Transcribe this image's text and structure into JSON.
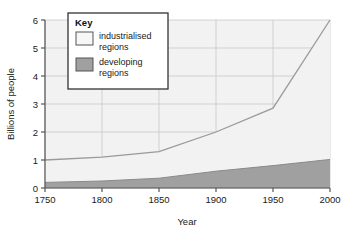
{
  "chart_data": {
    "type": "area",
    "title": "",
    "xlabel": "Year",
    "ylabel": "Billions of people",
    "x": [
      1750,
      1800,
      1850,
      1900,
      1950,
      2000
    ],
    "xlim": [
      1750,
      2000
    ],
    "ylim": [
      0,
      6
    ],
    "xticks": [
      "1750",
      "1800",
      "1850",
      "1900",
      "1950",
      "2000"
    ],
    "yticks": [
      "0",
      "1",
      "2",
      "3",
      "4",
      "5",
      "6"
    ],
    "grid": true,
    "stacked": true,
    "legend_position": "top-left-inside",
    "legend_title": "Key",
    "series": [
      {
        "name": "developing regions",
        "values": [
          0.2,
          0.25,
          0.35,
          0.6,
          0.8,
          1.02
        ],
        "color": "#a0a0a0"
      },
      {
        "name": "industrialised regions",
        "values": [
          0.8,
          0.85,
          0.95,
          1.4,
          2.05,
          4.98
        ],
        "color": "#f2f2f2"
      }
    ],
    "totals": [
      1.0,
      1.1,
      1.3,
      2.0,
      2.85,
      6.0
    ],
    "annotations": []
  },
  "axes": {
    "y_title": "Billions of people",
    "x_title": "Year",
    "y_ticks": [
      "6",
      "5",
      "4",
      "3",
      "2",
      "1",
      "0"
    ],
    "x_ticks": [
      "1750",
      "1800",
      "1850",
      "1900",
      "1950",
      "2000"
    ]
  },
  "legend": {
    "title": "Key",
    "entries": [
      {
        "label_line1": "industrialised",
        "label_line2": "regions",
        "swatch": "#f7f7f7"
      },
      {
        "label_line1": "developing",
        "label_line2": "regions",
        "swatch": "#a0a0a0"
      }
    ]
  },
  "colors": {
    "plot_background": "#f2f2f2",
    "grid": "#c8c8c8",
    "axis": "#555555",
    "developing_fill": "#a0a0a0",
    "industrialised_fill": "#f2f2f2",
    "line": "#9a9a9a",
    "text": "#1a1a1a",
    "legend_border": "#333333",
    "legend_background": "#ffffff"
  }
}
